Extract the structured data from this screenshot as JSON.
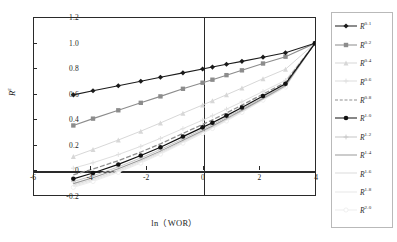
{
  "chart_data": {
    "type": "line",
    "title": "",
    "xlabel": "ln（WOR）",
    "ylabel": "R",
    "ylabel_sup": "ε",
    "xlim": [
      -6,
      4
    ],
    "ylim": [
      -0.2,
      1.2
    ],
    "xticks": [
      "-6",
      "-4",
      "-2",
      "0",
      "2",
      "4"
    ],
    "xtick_values": [
      -6,
      -4,
      -2,
      0,
      2,
      4
    ],
    "yticks": [
      "1.2",
      "1.0",
      "0.8",
      "0.6",
      "0.4",
      "0.2",
      "0",
      "-0.2"
    ],
    "ytick_values": [
      1.2,
      1.0,
      0.8,
      0.6,
      0.4,
      0.2,
      0,
      -0.2
    ],
    "grid": false,
    "legend_position": "right",
    "convergence_point": [
      4,
      1.0
    ],
    "x": [
      -4.6,
      -3.9,
      -3.0,
      -2.2,
      -1.5,
      -0.7,
      0.0,
      0.35,
      0.85,
      1.4,
      2.15,
      2.95,
      4.0
    ],
    "series": [
      {
        "name": "R",
        "exponent": "0.1",
        "label_sup": "0.1",
        "color": "#1b1b1b",
        "marker": "diamond",
        "width": 1.1,
        "dash": "none",
        "values": [
          0.592,
          0.625,
          0.664,
          0.7,
          0.731,
          0.766,
          0.797,
          0.812,
          0.834,
          0.857,
          0.89,
          0.925,
          1.0
        ]
      },
      {
        "name": "R",
        "exponent": "0.2",
        "label_sup": "0.2",
        "color": "#8c8c8c",
        "marker": "square",
        "width": 1.1,
        "dash": "none",
        "values": [
          0.35,
          0.404,
          0.47,
          0.529,
          0.58,
          0.64,
          0.688,
          0.712,
          0.748,
          0.786,
          0.84,
          0.894,
          1.0
        ]
      },
      {
        "name": "R",
        "exponent": "0.4",
        "label_sup": "0.4",
        "color": "#d7d7d7",
        "marker": "triangle",
        "width": 1.0,
        "dash": "none",
        "values": [
          0.104,
          0.16,
          0.235,
          0.305,
          0.37,
          0.447,
          0.512,
          0.545,
          0.593,
          0.646,
          0.72,
          0.795,
          1.0
        ]
      },
      {
        "name": "R",
        "exponent": "0.6",
        "label_sup": "0.6",
        "color": "#dedede",
        "marker": "cross",
        "width": 1.0,
        "dash": "none",
        "values": [
          0.012,
          0.055,
          0.12,
          0.185,
          0.248,
          0.325,
          0.392,
          0.427,
          0.479,
          0.537,
          0.619,
          0.707,
          1.0
        ]
      },
      {
        "name": "R",
        "exponent": "0.8",
        "label_sup": "0.8",
        "color": "#8f8f8f",
        "marker": "dashline",
        "width": 1.3,
        "dash": "5,2",
        "values": [
          -0.04,
          0.005,
          0.072,
          0.14,
          0.205,
          0.287,
          0.358,
          0.394,
          0.449,
          0.511,
          0.598,
          0.691,
          1.0
        ]
      },
      {
        "name": "R",
        "exponent": "1.0",
        "label_sup": "1.0",
        "color": "#111111",
        "marker": "circle",
        "width": 1.2,
        "dash": "none",
        "values": [
          -0.072,
          -0.026,
          0.042,
          0.112,
          0.178,
          0.262,
          0.335,
          0.372,
          0.428,
          0.492,
          0.583,
          0.68,
          1.0
        ]
      },
      {
        "name": "R",
        "exponent": "1.2",
        "label_sup": "1.2",
        "color": "#c6c6c6",
        "marker": "plus",
        "width": 1.0,
        "dash": "none",
        "values": [
          -0.094,
          -0.048,
          0.022,
          0.093,
          0.16,
          0.245,
          0.32,
          0.357,
          0.414,
          0.479,
          0.572,
          0.671,
          1.0
        ]
      },
      {
        "name": "R",
        "exponent": "1.4",
        "label_sup": "1.4",
        "color": "#9a9a9a",
        "marker": "line",
        "width": 1.1,
        "dash": "none",
        "values": [
          -0.11,
          -0.064,
          0.007,
          0.079,
          0.147,
          0.233,
          0.308,
          0.346,
          0.404,
          0.47,
          0.564,
          0.665,
          1.0
        ]
      },
      {
        "name": "R",
        "exponent": "1.6",
        "label_sup": "1.6",
        "color": "#dcdcdc",
        "marker": "line",
        "width": 1.0,
        "dash": "none",
        "values": [
          -0.122,
          -0.076,
          -0.005,
          0.068,
          0.137,
          0.223,
          0.299,
          0.338,
          0.396,
          0.463,
          0.558,
          0.66,
          1.0
        ]
      },
      {
        "name": "R",
        "exponent": "1.8",
        "label_sup": "1.8",
        "color": "#e8e8e8",
        "marker": "line",
        "width": 1.0,
        "dash": "none",
        "values": [
          -0.132,
          -0.085,
          -0.014,
          0.059,
          0.129,
          0.216,
          0.292,
          0.331,
          0.39,
          0.458,
          0.554,
          0.656,
          1.0
        ]
      },
      {
        "name": "R",
        "exponent": "2.0",
        "label_sup": "2.0",
        "color": "#ededed",
        "marker": "circle-open",
        "width": 1.0,
        "dash": "none",
        "values": [
          -0.14,
          -0.093,
          -0.021,
          0.052,
          0.123,
          0.21,
          0.287,
          0.326,
          0.385,
          0.453,
          0.55,
          0.653,
          1.0
        ]
      }
    ]
  },
  "legend": {
    "items": [
      {
        "label": "R",
        "sup": "0.1"
      },
      {
        "label": "R",
        "sup": "0.2"
      },
      {
        "label": "R",
        "sup": "0.4"
      },
      {
        "label": "R",
        "sup": "0.6"
      },
      {
        "label": "R",
        "sup": "0.8"
      },
      {
        "label": "R",
        "sup": "1.0"
      },
      {
        "label": "R",
        "sup": "1.2"
      },
      {
        "label": "R",
        "sup": "1.4"
      },
      {
        "label": "R",
        "sup": "1.6"
      },
      {
        "label": "R",
        "sup": "1.8"
      },
      {
        "label": "R",
        "sup": "2.0"
      }
    ]
  }
}
